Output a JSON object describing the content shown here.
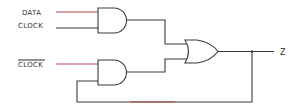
{
  "diagram": {
    "type": "logic-circuit",
    "inputs": [
      {
        "label": "DATA",
        "overbar": false
      },
      {
        "label": "CLOCK",
        "overbar": false
      },
      {
        "label": "CLOCK",
        "overbar": true
      }
    ],
    "gates": [
      {
        "id": "and1",
        "type": "AND",
        "inputs": [
          "DATA",
          "CLOCK"
        ]
      },
      {
        "id": "and2",
        "type": "AND",
        "inputs": [
          "NOT CLOCK",
          "Z (feedback)"
        ]
      },
      {
        "id": "or1",
        "type": "OR",
        "inputs": [
          "and1",
          "and2"
        ]
      }
    ],
    "output": {
      "label": "Z"
    },
    "colors": {
      "wire": "#3a3a3a",
      "wire_accent": "#b5484e"
    }
  }
}
